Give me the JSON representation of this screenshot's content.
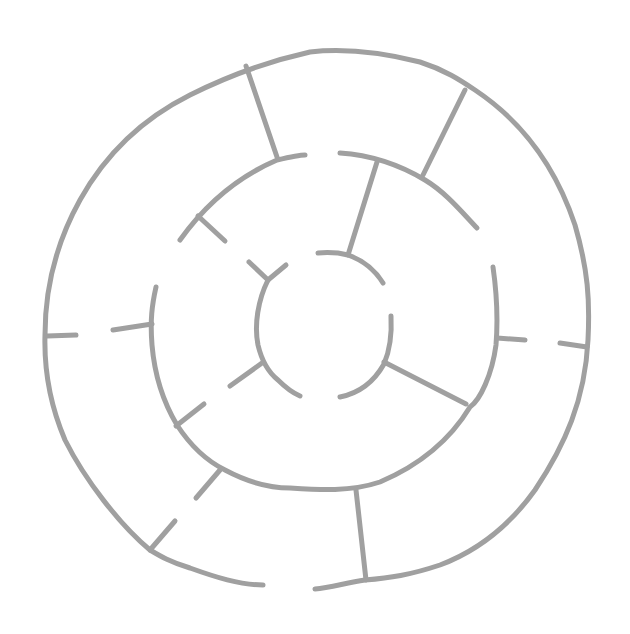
{
  "image": {
    "title": "Circular maze",
    "description": "Hand-drawn circular maze with three concentric rings and radial walls, gray strokes on white background",
    "background": "#ffffff",
    "stroke_color": "#a0a0a0",
    "stroke_width": 5,
    "canvas": {
      "width": 630,
      "height": 634
    }
  },
  "maze": {
    "entrance": "gap in outer ring at bottom",
    "rings": [
      "outer",
      "middle",
      "inner",
      "center"
    ]
  }
}
